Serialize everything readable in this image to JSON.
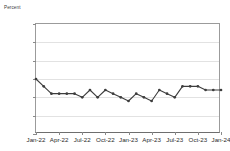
{
  "chart_data": {
    "type": "line",
    "title": "",
    "ylabel": "Percent",
    "xlabel": "",
    "ylim": [
      2.5,
      5.5
    ],
    "ytick_values": [
      5.5,
      5.0,
      4.5,
      4.0,
      3.5,
      3.0,
      2.5
    ],
    "ytick_labels": [
      "5.5",
      "5.0",
      "4.5",
      "4.0",
      "3.5",
      "3.0",
      "2.5"
    ],
    "grid": true,
    "legend": "none",
    "series_color": "#3d3d3d",
    "xtick_labels": [
      "Jan-22",
      "Apr-22",
      "Jul-22",
      "Oct-22",
      "Jan-23",
      "Apr-23",
      "Jul-23",
      "Oct-23",
      "Jan-24"
    ],
    "xtick_indices": [
      0,
      3,
      6,
      9,
      12,
      15,
      18,
      21,
      24
    ],
    "x": [
      "Jan-22",
      "Feb-22",
      "Mar-22",
      "Apr-22",
      "May-22",
      "Jun-22",
      "Jul-22",
      "Aug-22",
      "Sep-22",
      "Oct-22",
      "Nov-22",
      "Dec-22",
      "Jan-23",
      "Feb-23",
      "Mar-23",
      "Apr-23",
      "May-23",
      "Jun-23",
      "Jul-23",
      "Aug-23",
      "Sep-23",
      "Oct-23",
      "Nov-23",
      "Dec-23",
      "Jan-24"
    ],
    "series": [
      {
        "name": "Unemployment rate",
        "values": [
          4.0,
          3.8,
          3.6,
          3.6,
          3.6,
          3.6,
          3.5,
          3.7,
          3.5,
          3.7,
          3.6,
          3.5,
          3.4,
          3.6,
          3.5,
          3.4,
          3.7,
          3.6,
          3.5,
          3.8,
          3.8,
          3.8,
          3.7,
          3.7,
          3.7
        ]
      }
    ]
  }
}
